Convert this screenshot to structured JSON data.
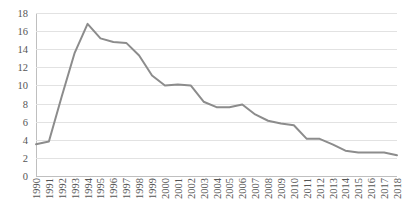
{
  "chart_data": {
    "type": "line",
    "title": "",
    "xlabel": "",
    "ylabel": "",
    "ylim": [
      0,
      18
    ],
    "ytick_step": 2,
    "yticks": [
      18,
      16,
      14,
      12,
      10,
      8,
      6,
      4,
      2,
      0
    ],
    "grid": true,
    "legend": false,
    "legend_position": "none",
    "line_color": "#8c8c8c",
    "grid_color": "#e2e2e2",
    "axis_color": "#bfbfbf",
    "tick_label_color": "#555555",
    "categories": [
      "1990",
      "1991",
      "1992",
      "1993",
      "1994",
      "1995",
      "1996",
      "1997",
      "1998",
      "1999",
      "2000",
      "2001",
      "2002",
      "2003",
      "2004",
      "2005",
      "2006",
      "2007",
      "2008",
      "2009",
      "2010",
      "2011",
      "2012",
      "2013",
      "2014",
      "2015",
      "2016",
      "2017",
      "2018"
    ],
    "values": [
      3.5,
      3.8,
      8.8,
      13.6,
      16.8,
      15.2,
      14.8,
      14.7,
      13.3,
      11.1,
      10.0,
      10.1,
      10.0,
      8.2,
      7.6,
      7.6,
      7.9,
      6.8,
      6.1,
      5.8,
      5.6,
      4.1,
      4.1,
      3.5,
      2.8,
      2.6,
      2.6,
      2.6,
      2.3
    ]
  }
}
